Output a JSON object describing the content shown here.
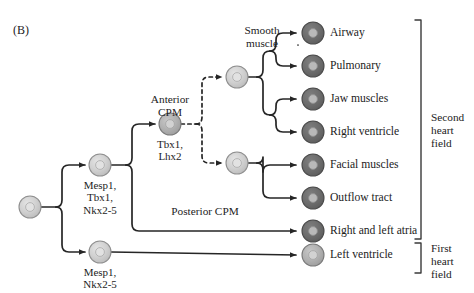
{
  "figure": {
    "panel_label": "(B)",
    "background_color": "#ffffff",
    "text_color": "#1c1c1c"
  },
  "colors": {
    "cell_light_fill": "#cfcfcf",
    "cell_light_stroke": "#8f8f8f",
    "cell_mid_fill": "#b4b4b4",
    "cell_mid_stroke": "#7a7a7a",
    "cell_dark_fill": "#6e6e6e",
    "cell_dark_stroke": "#4a4a4a",
    "nucleus_light": "#e2e2e2",
    "nucleus_dark": "#b9b9b9",
    "line_color": "#262626",
    "bracket_color": "#3a3a3a"
  },
  "progenitors": [
    {
      "id": "root",
      "name": "root-progenitor",
      "shade": "light",
      "cx": 30,
      "cy": 207,
      "r": 11,
      "genes": ""
    },
    {
      "id": "cpm-branch",
      "name": "cardiopharyngeal-mesoderm-progenitor",
      "shade": "light",
      "cx": 100,
      "cy": 165,
      "r": 11,
      "genes": "Mesp1,\nTbx1,\nNkx2-5"
    },
    {
      "id": "fhf-progenitor",
      "name": "first-heart-field-progenitor",
      "shade": "light",
      "cx": 100,
      "cy": 252,
      "r": 11,
      "genes": "Mesp1,\nNkx2-5"
    },
    {
      "id": "anterior-cpm",
      "name": "anterior-cpm-progenitor",
      "shade": "mid",
      "cx": 170,
      "cy": 124,
      "r": 11,
      "genes": "Tbx1,\nLhx2"
    },
    {
      "id": "upper-split",
      "name": "upper-bifurcation-progenitor",
      "shade": "light",
      "cx": 237,
      "cy": 77,
      "r": 11,
      "genes": ""
    },
    {
      "id": "lower-split",
      "name": "lower-bifurcation-progenitor",
      "shade": "light",
      "cx": 237,
      "cy": 163,
      "r": 11,
      "genes": ""
    }
  ],
  "pathway_labels": [
    {
      "name": "anterior-cpm-label",
      "text": "Anterior\nCPM",
      "x": 170,
      "y": 93
    },
    {
      "name": "posterior-cpm-label",
      "text": "Posterior CPM",
      "x": 205,
      "y": 205
    },
    {
      "name": "smooth-muscle-label",
      "text": "Smooth\nmuscle",
      "x": 262,
      "y": 24
    }
  ],
  "terminal_cells": [
    {
      "name": "terminal-airway",
      "label": "Airway",
      "shade": "dark",
      "cx": 313,
      "cy": 33,
      "r": 11
    },
    {
      "name": "terminal-pulmonary",
      "label": "Pulmonary",
      "shade": "dark",
      "cx": 313,
      "cy": 66,
      "r": 11
    },
    {
      "name": "terminal-jaw-muscles",
      "label": "Jaw muscles",
      "shade": "dark",
      "cx": 313,
      "cy": 99,
      "r": 11
    },
    {
      "name": "terminal-right-ventricle",
      "label": "Right ventricle",
      "shade": "dark",
      "cx": 313,
      "cy": 132,
      "r": 11
    },
    {
      "name": "terminal-facial-muscles",
      "label": "Facial muscles",
      "shade": "dark",
      "cx": 313,
      "cy": 165,
      "r": 11
    },
    {
      "name": "terminal-outflow-tract",
      "label": "Outflow tract",
      "shade": "dark",
      "cx": 313,
      "cy": 198,
      "r": 11
    },
    {
      "name": "terminal-right-left-atria",
      "label": "Right and left atria",
      "shade": "dark",
      "cx": 313,
      "cy": 231,
      "r": 11
    },
    {
      "name": "terminal-left-ventricle",
      "label": "Left ventricle",
      "shade": "mid",
      "cx": 313,
      "cy": 255,
      "r": 11
    }
  ],
  "field_brackets": [
    {
      "name": "second-heart-field-bracket",
      "label": "Second\nheart\nfield",
      "x": 421,
      "top": 20,
      "bottom": 239,
      "label_x": 431,
      "label_y": 111
    },
    {
      "name": "first-heart-field-bracket",
      "label": "First\nheart\nfield",
      "x": 421,
      "top": 243,
      "bottom": 273,
      "label_x": 431,
      "label_y": 242
    }
  ]
}
